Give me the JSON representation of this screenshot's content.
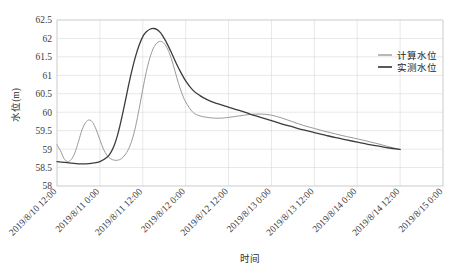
{
  "chart_data": {
    "type": "line",
    "title": "",
    "xlabel": "时间",
    "ylabel": "水位(m)",
    "ylim": [
      58,
      62.5
    ],
    "ytick_labels": [
      "62.5",
      "62",
      "61.5",
      "61",
      "60.5",
      "60",
      "59.5",
      "59",
      "58.5",
      "58"
    ],
    "ytick_values": [
      62.5,
      62,
      61.5,
      61,
      60.5,
      60,
      59.5,
      59,
      58.5,
      58
    ],
    "xtick_labels": [
      "2019/8/10 12:00",
      "2019/8/11 0:00",
      "2019/8/11 12:00",
      "2019/8/12 0:00",
      "2019/8/12 12:00",
      "2019/8/13 0:00",
      "2019/8/13 12:00",
      "2019/8/14 0:00",
      "2019/8/14 12:00",
      "2019/8/15 0:00"
    ],
    "xlim_hours": [
      0,
      108
    ],
    "grid": true,
    "legend_position": "upper-right",
    "series": [
      {
        "name": "计算水位",
        "color": "#9a9a9a",
        "width": 1.0,
        "x_hours": [
          0,
          1,
          2,
          3,
          4,
          5,
          6,
          7,
          8,
          9,
          10,
          11,
          12,
          13,
          14,
          15,
          16,
          17,
          18,
          19,
          20,
          21,
          22,
          23,
          24,
          25,
          26,
          27,
          28,
          29,
          30,
          31,
          32,
          33,
          34,
          35,
          36,
          38,
          40,
          42,
          44,
          46,
          48,
          51,
          54,
          57,
          60,
          63,
          66,
          69,
          72,
          75,
          78,
          81,
          84,
          87,
          90,
          93,
          96
        ],
        "values": [
          59.12,
          58.95,
          58.74,
          58.66,
          58.72,
          58.9,
          59.2,
          59.52,
          59.72,
          59.79,
          59.72,
          59.52,
          59.25,
          59.0,
          58.83,
          58.74,
          58.7,
          58.7,
          58.74,
          58.84,
          59.0,
          59.25,
          59.62,
          60.1,
          60.62,
          61.1,
          61.48,
          61.74,
          61.88,
          61.92,
          61.86,
          61.7,
          61.45,
          61.12,
          60.78,
          60.5,
          60.28,
          60.0,
          59.9,
          59.86,
          59.84,
          59.84,
          59.86,
          59.9,
          59.94,
          59.95,
          59.92,
          59.84,
          59.74,
          59.64,
          59.56,
          59.48,
          59.41,
          59.34,
          59.28,
          59.21,
          59.14,
          59.06,
          58.99
        ]
      },
      {
        "name": "实测水位",
        "color": "#3c3c3c",
        "width": 1.3,
        "x_hours": [
          0,
          2,
          4,
          6,
          8,
          10,
          12,
          14,
          15,
          16,
          17,
          18,
          19,
          20,
          21,
          22,
          23,
          24,
          25,
          26,
          27,
          28,
          29,
          30,
          31,
          32,
          33,
          34,
          36,
          38,
          40,
          42,
          44,
          46,
          48,
          51,
          54,
          57,
          60,
          63,
          66,
          69,
          72,
          75,
          78,
          81,
          84,
          87,
          90,
          93,
          96
        ],
        "values": [
          58.66,
          58.64,
          58.62,
          58.6,
          58.6,
          58.62,
          58.66,
          58.78,
          58.9,
          59.1,
          59.4,
          59.8,
          60.25,
          60.72,
          61.15,
          61.52,
          61.82,
          62.05,
          62.18,
          62.25,
          62.27,
          62.24,
          62.15,
          62.0,
          61.82,
          61.62,
          61.4,
          61.2,
          60.85,
          60.6,
          60.45,
          60.34,
          60.26,
          60.2,
          60.14,
          60.05,
          59.95,
          59.86,
          59.77,
          59.68,
          59.6,
          59.52,
          59.45,
          59.38,
          59.31,
          59.25,
          59.19,
          59.13,
          59.08,
          59.03,
          58.99
        ]
      }
    ]
  },
  "legend": {
    "items": [
      {
        "label": "计算水位"
      },
      {
        "label": "实测水位"
      }
    ]
  },
  "caption": ""
}
